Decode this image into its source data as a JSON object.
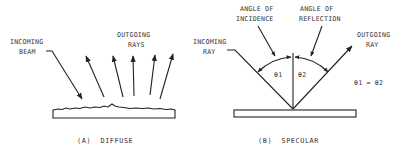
{
  "diffuse": {
    "incoming_label_line1": "INCOMING",
    "incoming_label_line2": "BEAM",
    "outgoing_label_line1": "OUTGOING",
    "outgoing_label_line2": "RAYS",
    "caption": "(A)  DIFFUSE"
  },
  "specular": {
    "incoming_label_line1": "INCOMING",
    "incoming_label_line2": "RAY",
    "incidence_label_line1": "ANGLE OF",
    "incidence_label_line2": "INCIDENCE",
    "reflection_label_line1": "ANGLE OF",
    "reflection_label_line2": "REFLECTION",
    "outgoing_label_line1": "OUTGOING",
    "outgoing_label_line2": "RAY",
    "theta1": "θ1",
    "theta2": "θ2",
    "equation": "θ1 = θ2",
    "caption": "(B)  SPECULAR"
  },
  "colors": {
    "ink": "#222222",
    "background": "#ffffff"
  }
}
